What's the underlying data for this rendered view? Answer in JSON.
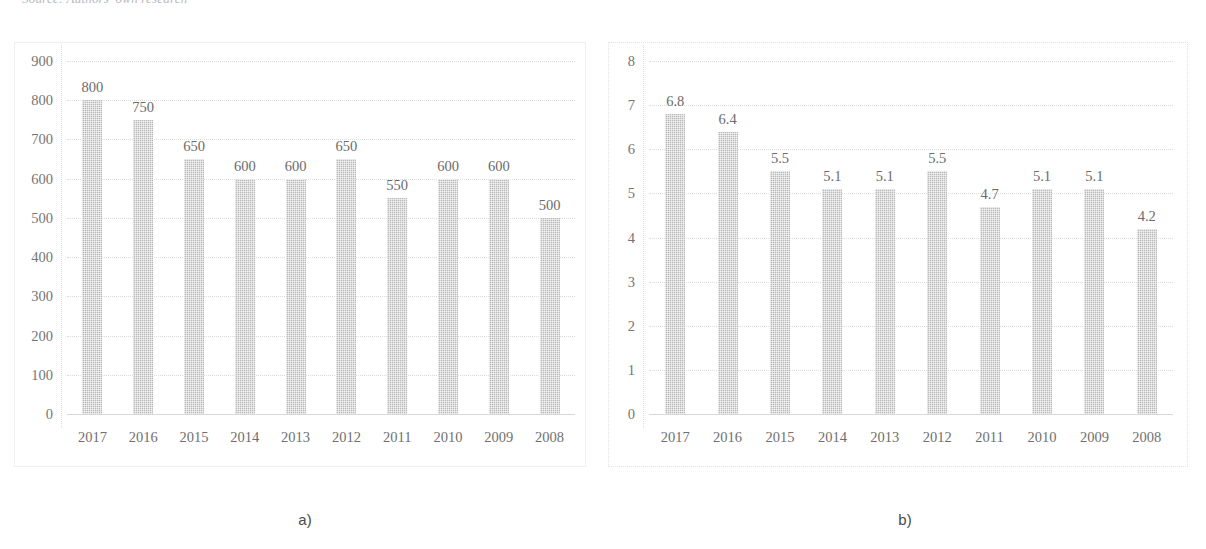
{
  "page": {
    "source_caption": "Source: Authors' own research",
    "background_color": "#ffffff"
  },
  "figures": [
    {
      "key": "figure_a",
      "caption": "a)",
      "bar_color": "#b9b9b9"
    },
    {
      "key": "figure_b",
      "caption": "b)",
      "bar_color": "#b9b9b9"
    }
  ],
  "chart_data": [
    {
      "id": "chart-a",
      "type": "bar",
      "title": "",
      "subtitle": "a)",
      "xlabel": "",
      "ylabel": "",
      "categories": [
        "2017",
        "2016",
        "2015",
        "2014",
        "2013",
        "2012",
        "2011",
        "2010",
        "2009",
        "2008"
      ],
      "values": [
        800,
        750,
        650,
        600,
        600,
        650,
        550,
        600,
        600,
        500
      ],
      "data_labels": [
        "800",
        "750",
        "650",
        "600",
        "600",
        "650",
        "550",
        "600",
        "600",
        "500"
      ],
      "ylim": [
        0,
        900
      ],
      "yticks": [
        900,
        800,
        700,
        600,
        500,
        400,
        300,
        200,
        100,
        0
      ],
      "ytick_labels": [
        "900",
        "800",
        "700",
        "600",
        "500",
        "400",
        "300",
        "200",
        "100",
        "0"
      ],
      "grid": true,
      "legend": false,
      "legend_position": "none",
      "series": [
        {
          "name": "series-a",
          "values": [
            800,
            750,
            650,
            600,
            600,
            650,
            550,
            600,
            600,
            500
          ]
        }
      ]
    },
    {
      "id": "chart-b",
      "type": "bar",
      "title": "",
      "subtitle": "b)",
      "xlabel": "",
      "ylabel": "",
      "categories": [
        "2017",
        "2016",
        "2015",
        "2014",
        "2013",
        "2012",
        "2011",
        "2010",
        "2009",
        "2008"
      ],
      "values": [
        6.8,
        6.4,
        5.5,
        5.1,
        5.1,
        5.5,
        4.7,
        5.1,
        5.1,
        4.2
      ],
      "data_labels": [
        "6.8",
        "6.4",
        "5.5",
        "5.1",
        "5.1",
        "5.5",
        "4.7",
        "5.1",
        "5.1",
        "4.2"
      ],
      "ylim": [
        0,
        8
      ],
      "yticks": [
        8,
        7,
        6,
        5,
        4,
        3,
        2,
        1,
        0
      ],
      "ytick_labels": [
        "8",
        "7",
        "6",
        "5",
        "4",
        "3",
        "2",
        "1",
        "0"
      ],
      "grid": true,
      "legend": false,
      "legend_position": "none",
      "series": [
        {
          "name": "series-b",
          "values": [
            6.8,
            6.4,
            5.5,
            5.1,
            5.1,
            5.5,
            4.7,
            5.1,
            5.1,
            4.2
          ]
        }
      ]
    }
  ]
}
